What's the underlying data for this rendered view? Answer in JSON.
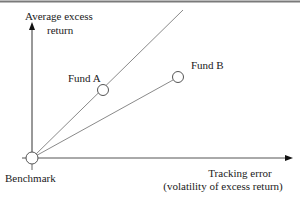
{
  "diagram": {
    "y_axis_label_line1": "Average excess",
    "y_axis_label_line2": "return",
    "x_axis_label_line1": "Tracking error",
    "x_axis_label_line2": "(volatility of excess return)",
    "points": [
      {
        "label": "Benchmark"
      },
      {
        "label": "Fund A"
      },
      {
        "label": "Fund B"
      }
    ],
    "colors": {
      "line": "#8a8a8a",
      "axis": "#333333",
      "text": "#1a1a1a",
      "border": "#7a7a7a"
    }
  }
}
